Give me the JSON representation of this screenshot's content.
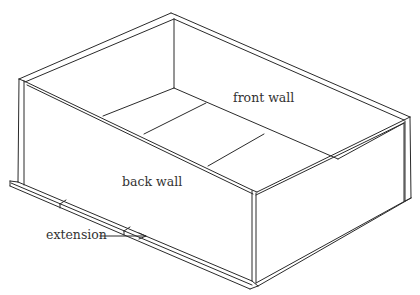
{
  "figure": {
    "type": "technical-illustration",
    "line_color": "#2a2a2a",
    "background": "#ffffff",
    "labels": {
      "front_wall": "front wall",
      "back_wall": "back wall",
      "extension": "extension"
    }
  }
}
